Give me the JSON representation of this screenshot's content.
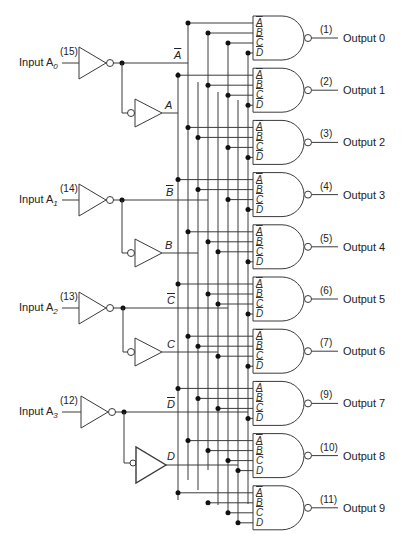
{
  "inputs": [
    {
      "label": "Input A",
      "sub": "0",
      "pin": "(15)",
      "inv": "A",
      "buf": "A"
    },
    {
      "label": "Input A",
      "sub": "1",
      "pin": "(14)",
      "inv": "B",
      "buf": "B"
    },
    {
      "label": "Input A",
      "sub": "2",
      "pin": "(13)",
      "inv": "C",
      "buf": "C"
    },
    {
      "label": "Input A",
      "sub": "3",
      "pin": "(12)",
      "inv": "D",
      "buf": "D"
    }
  ],
  "gate_inputs": [
    "A",
    "B",
    "C",
    "D"
  ],
  "outputs": [
    {
      "pin": "(1)",
      "label": "Output 0"
    },
    {
      "pin": "(2)",
      "label": "Output 1"
    },
    {
      "pin": "(3)",
      "label": "Output 2"
    },
    {
      "pin": "(4)",
      "label": "Output 3"
    },
    {
      "pin": "(5)",
      "label": "Output 4"
    },
    {
      "pin": "(6)",
      "label": "Output 5"
    },
    {
      "pin": "(7)",
      "label": "Output 6"
    },
    {
      "pin": "(9)",
      "label": "Output 7"
    },
    {
      "pin": "(10)",
      "label": "Output 8"
    },
    {
      "pin": "(11)",
      "label": "Output 9"
    }
  ]
}
